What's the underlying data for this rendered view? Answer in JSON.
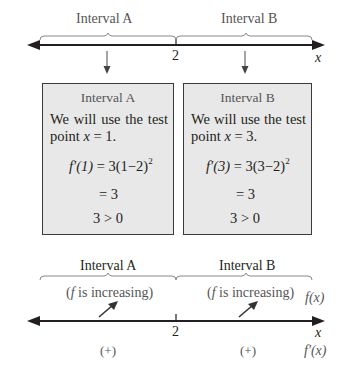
{
  "top_axis": {
    "intervals": [
      {
        "label": "Interval A"
      },
      {
        "label": "Interval B"
      }
    ],
    "tick_label": "2",
    "axis_label": "x"
  },
  "boxes": [
    {
      "title": "Interval A",
      "text_line1": "We will use the test",
      "text_line2_prefix": "point ",
      "test_var": "x",
      "test_value": " = 1.",
      "eq1_lhs": "f′(1)",
      "eq1_rhs": " = 3(1−2)",
      "exponent": "2",
      "eq2": "= 3",
      "conclusion": "3 > 0"
    },
    {
      "title": "Interval B",
      "text_line1": "We will use the test",
      "text_line2_prefix": "point ",
      "test_var": "x",
      "test_value": " = 3.",
      "eq1_lhs": "f′(3)",
      "eq1_rhs": " = 3(3−2)",
      "exponent": "2",
      "eq2": "= 3",
      "conclusion": "3 > 0"
    }
  ],
  "bottom_axis": {
    "intervals": [
      {
        "label": "Interval A",
        "behavior_f": "f",
        "behavior_text": " is increasing)",
        "sign": "(+)"
      },
      {
        "label": "Interval B",
        "behavior_f": "f",
        "behavior_text": " is increasing)",
        "sign": "(+)"
      }
    ],
    "tick_label": "2",
    "axis_label": "x",
    "row_label_f": "f(x)",
    "row_label_fprime": "f′(x)"
  }
}
